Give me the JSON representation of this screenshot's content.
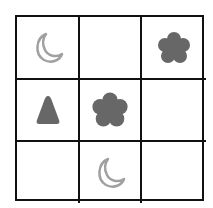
{
  "puzzle": {
    "rows": 3,
    "cols": 3,
    "colors": {
      "line": "#111111",
      "shape_dark": "#676767",
      "moon_outline": "#a0a0a0",
      "background": "#ffffff"
    },
    "cells": [
      {
        "row": 1,
        "col": 1,
        "shape": "crescent-moon-outline"
      },
      {
        "row": 1,
        "col": 2,
        "shape": "empty"
      },
      {
        "row": 1,
        "col": 3,
        "shape": "flower-filled"
      },
      {
        "row": 2,
        "col": 1,
        "shape": "triangle-filled"
      },
      {
        "row": 2,
        "col": 2,
        "shape": "flower-filled"
      },
      {
        "row": 2,
        "col": 3,
        "shape": "empty"
      },
      {
        "row": 3,
        "col": 1,
        "shape": "empty"
      },
      {
        "row": 3,
        "col": 2,
        "shape": "crescent-moon-outline"
      },
      {
        "row": 3,
        "col": 3,
        "shape": "empty"
      }
    ]
  }
}
